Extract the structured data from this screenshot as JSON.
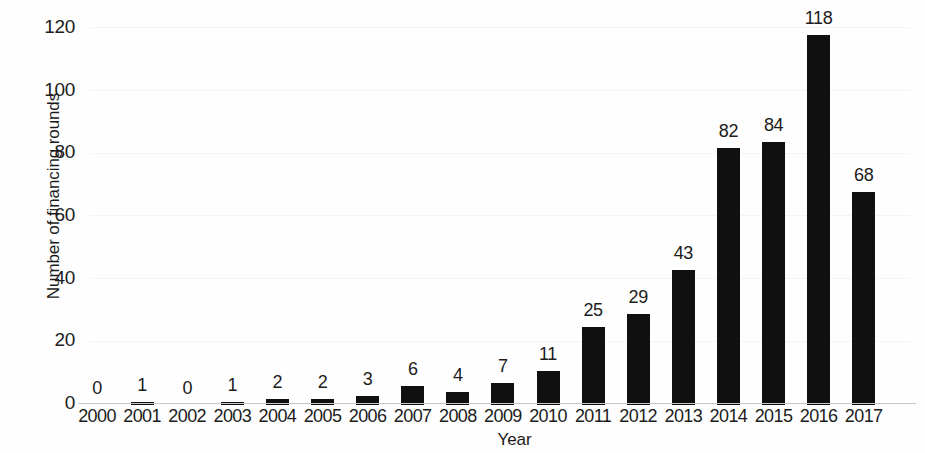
{
  "chart_data": {
    "type": "bar",
    "title": "",
    "subtitle": "",
    "xlabel": "Year",
    "ylabel": "Number of financing rounds",
    "categories": [
      "2000",
      "2001",
      "2002",
      "2003",
      "2004",
      "2005",
      "2006",
      "2007",
      "2008",
      "2009",
      "2010",
      "2011",
      "2012",
      "2013",
      "2014",
      "2015",
      "2016",
      "2017"
    ],
    "values": [
      0,
      1,
      0,
      1,
      2,
      2,
      3,
      6,
      4,
      7,
      11,
      25,
      29,
      43,
      82,
      84,
      118,
      68
    ],
    "value_labels": [
      "0",
      "1",
      "0",
      "1",
      "2",
      "2",
      "3",
      "6",
      "4",
      "7",
      "11",
      "25",
      "29",
      "43",
      "82",
      "84",
      "118",
      "68"
    ],
    "ylim": [
      0,
      120
    ],
    "y_ticks": [
      0,
      20,
      40,
      60,
      80,
      100,
      120
    ],
    "y_tick_labels": [
      "0",
      "20",
      "40",
      "60",
      "80",
      "100",
      "120"
    ],
    "grid": false,
    "legend": null,
    "bar_color": "#101010",
    "axis_color": "#c9c9c9",
    "data_labels_shown": true
  }
}
